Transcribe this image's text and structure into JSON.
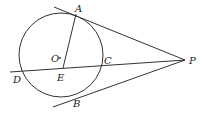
{
  "diagram": {
    "type": "geometry",
    "circle": {
      "center": "O",
      "cx": 61,
      "cy": 55,
      "r": 42
    },
    "points": {
      "A": {
        "label": "A",
        "x": 76,
        "y": 14
      },
      "B": {
        "label": "B",
        "x": 67,
        "y": 96
      },
      "C": {
        "label": "C",
        "x": 102,
        "y": 64
      },
      "D": {
        "label": "D",
        "x": 20,
        "y": 70
      },
      "E": {
        "label": "E",
        "x": 63,
        "y": 67
      },
      "O": {
        "label": "O",
        "x": 58,
        "y": 58
      },
      "P": {
        "label": "P",
        "x": 185,
        "y": 60
      }
    },
    "segments": [
      {
        "name": "tangent-PA",
        "from": [
          54,
          7
        ],
        "to": [
          185,
          60
        ]
      },
      {
        "name": "tangent-PB",
        "from": [
          53,
          107
        ],
        "to": [
          185,
          60
        ]
      },
      {
        "name": "secant-PD",
        "from": [
          10,
          72
        ],
        "to": [
          185,
          60
        ]
      },
      {
        "name": "chord-AE",
        "from": [
          76,
          14
        ],
        "to": [
          63,
          68
        ]
      }
    ],
    "colors": {
      "stroke": "#333333",
      "background": "#ffffff"
    }
  }
}
